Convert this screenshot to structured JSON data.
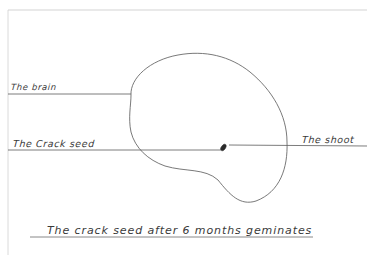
{
  "diagram": {
    "type": "hand-drawn biology diagram",
    "labels": {
      "brain": "The brain",
      "crack_seed": "The Crack seed",
      "shoot": "The shoot"
    },
    "caption": "The crack seed after 6 months geminates",
    "colors": {
      "background": "#ffffff",
      "ink": "#3a3a3a",
      "border": "#c8c8c8",
      "seed_dot": "#2a2a2a"
    }
  }
}
